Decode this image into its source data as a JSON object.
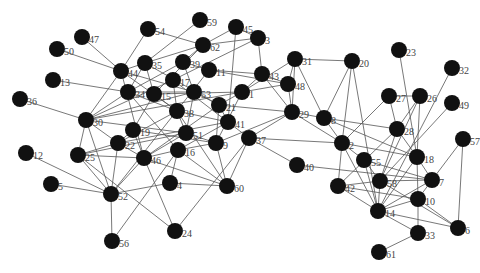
{
  "diagram": {
    "type": "network-graph",
    "node_color": "#111111",
    "edge_color": "#555555",
    "label_color": "#444444",
    "nodes": [
      {
        "id": "59",
        "x": 200,
        "y": 20
      },
      {
        "id": "45",
        "x": 236,
        "y": 27
      },
      {
        "id": "3",
        "x": 258,
        "y": 38
      },
      {
        "id": "62",
        "x": 203,
        "y": 45
      },
      {
        "id": "54",
        "x": 148,
        "y": 29
      },
      {
        "id": "47",
        "x": 82,
        "y": 37
      },
      {
        "id": "50",
        "x": 57,
        "y": 49
      },
      {
        "id": "44",
        "x": 121,
        "y": 71
      },
      {
        "id": "35",
        "x": 145,
        "y": 63
      },
      {
        "id": "39",
        "x": 183,
        "y": 62
      },
      {
        "id": "11",
        "x": 209,
        "y": 70
      },
      {
        "id": "17",
        "x": 173,
        "y": 80
      },
      {
        "id": "43",
        "x": 262,
        "y": 74
      },
      {
        "id": "31",
        "x": 295,
        "y": 59
      },
      {
        "id": "20",
        "x": 352,
        "y": 61
      },
      {
        "id": "13",
        "x": 53,
        "y": 80
      },
      {
        "id": "36",
        "x": 20,
        "y": 99
      },
      {
        "id": "34",
        "x": 128,
        "y": 92
      },
      {
        "id": "15",
        "x": 154,
        "y": 94
      },
      {
        "id": "53",
        "x": 194,
        "y": 92
      },
      {
        "id": "1",
        "x": 242,
        "y": 92
      },
      {
        "id": "48",
        "x": 288,
        "y": 84
      },
      {
        "id": "23",
        "x": 399,
        "y": 50
      },
      {
        "id": "32",
        "x": 452,
        "y": 68
      },
      {
        "id": "27",
        "x": 389,
        "y": 96
      },
      {
        "id": "26",
        "x": 420,
        "y": 96
      },
      {
        "id": "49",
        "x": 452,
        "y": 103
      },
      {
        "id": "30",
        "x": 86,
        "y": 120
      },
      {
        "id": "38",
        "x": 177,
        "y": 111
      },
      {
        "id": "21",
        "x": 219,
        "y": 105
      },
      {
        "id": "41",
        "x": 228,
        "y": 122
      },
      {
        "id": "29",
        "x": 292,
        "y": 112
      },
      {
        "id": "8",
        "x": 324,
        "y": 118
      },
      {
        "id": "28",
        "x": 397,
        "y": 129
      },
      {
        "id": "19",
        "x": 133,
        "y": 130
      },
      {
        "id": "51",
        "x": 186,
        "y": 133
      },
      {
        "id": "9",
        "x": 216,
        "y": 143
      },
      {
        "id": "37",
        "x": 249,
        "y": 138
      },
      {
        "id": "22",
        "x": 118,
        "y": 143
      },
      {
        "id": "25",
        "x": 78,
        "y": 155
      },
      {
        "id": "46",
        "x": 144,
        "y": 158
      },
      {
        "id": "16",
        "x": 178,
        "y": 150
      },
      {
        "id": "12",
        "x": 26,
        "y": 153
      },
      {
        "id": "2",
        "x": 342,
        "y": 143
      },
      {
        "id": "55",
        "x": 364,
        "y": 160
      },
      {
        "id": "18",
        "x": 417,
        "y": 157
      },
      {
        "id": "57",
        "x": 463,
        "y": 139
      },
      {
        "id": "40",
        "x": 297,
        "y": 165
      },
      {
        "id": "7",
        "x": 432,
        "y": 180
      },
      {
        "id": "42",
        "x": 338,
        "y": 186
      },
      {
        "id": "58",
        "x": 380,
        "y": 181
      },
      {
        "id": "10",
        "x": 418,
        "y": 199
      },
      {
        "id": "14",
        "x": 378,
        "y": 211
      },
      {
        "id": "6",
        "x": 458,
        "y": 228
      },
      {
        "id": "33",
        "x": 418,
        "y": 233
      },
      {
        "id": "61",
        "x": 379,
        "y": 252
      },
      {
        "id": "5",
        "x": 51,
        "y": 184
      },
      {
        "id": "52",
        "x": 111,
        "y": 194
      },
      {
        "id": "4",
        "x": 170,
        "y": 183
      },
      {
        "id": "60",
        "x": 227,
        "y": 186
      },
      {
        "id": "24",
        "x": 175,
        "y": 231
      },
      {
        "id": "56",
        "x": 112,
        "y": 241
      }
    ],
    "edges": [
      [
        "47",
        "44"
      ],
      [
        "50",
        "44"
      ],
      [
        "54",
        "44"
      ],
      [
        "54",
        "62"
      ],
      [
        "59",
        "35"
      ],
      [
        "45",
        "62"
      ],
      [
        "45",
        "3"
      ],
      [
        "45",
        "41"
      ],
      [
        "3",
        "62"
      ],
      [
        "3",
        "43"
      ],
      [
        "3",
        "17"
      ],
      [
        "62",
        "35"
      ],
      [
        "62",
        "39"
      ],
      [
        "62",
        "15"
      ],
      [
        "13",
        "34"
      ],
      [
        "36",
        "30"
      ],
      [
        "44",
        "35"
      ],
      [
        "44",
        "30"
      ],
      [
        "44",
        "38"
      ],
      [
        "44",
        "53"
      ],
      [
        "44",
        "46"
      ],
      [
        "35",
        "15"
      ],
      [
        "35",
        "34"
      ],
      [
        "35",
        "21"
      ],
      [
        "39",
        "34"
      ],
      [
        "39",
        "53"
      ],
      [
        "39",
        "11"
      ],
      [
        "11",
        "43"
      ],
      [
        "11",
        "48"
      ],
      [
        "11",
        "52"
      ],
      [
        "17",
        "30"
      ],
      [
        "17",
        "38"
      ],
      [
        "17",
        "41"
      ],
      [
        "43",
        "1"
      ],
      [
        "43",
        "48"
      ],
      [
        "43",
        "29"
      ],
      [
        "31",
        "48"
      ],
      [
        "31",
        "29"
      ],
      [
        "31",
        "20"
      ],
      [
        "31",
        "8"
      ],
      [
        "31",
        "1"
      ],
      [
        "20",
        "8"
      ],
      [
        "20",
        "2"
      ],
      [
        "20",
        "14"
      ],
      [
        "34",
        "30"
      ],
      [
        "34",
        "53"
      ],
      [
        "34",
        "38"
      ],
      [
        "34",
        "16"
      ],
      [
        "15",
        "1"
      ],
      [
        "15",
        "38"
      ],
      [
        "15",
        "19"
      ],
      [
        "53",
        "21"
      ],
      [
        "53",
        "30"
      ],
      [
        "53",
        "51"
      ],
      [
        "1",
        "21"
      ],
      [
        "1",
        "48"
      ],
      [
        "1",
        "9"
      ],
      [
        "48",
        "29"
      ],
      [
        "30",
        "22"
      ],
      [
        "30",
        "25"
      ],
      [
        "30",
        "52"
      ],
      [
        "30",
        "51"
      ],
      [
        "30",
        "1"
      ],
      [
        "38",
        "51"
      ],
      [
        "38",
        "41"
      ],
      [
        "38",
        "22"
      ],
      [
        "38",
        "60"
      ],
      [
        "21",
        "41"
      ],
      [
        "21",
        "9"
      ],
      [
        "21",
        "46"
      ],
      [
        "21",
        "29"
      ],
      [
        "41",
        "37"
      ],
      [
        "41",
        "22"
      ],
      [
        "41",
        "16"
      ],
      [
        "29",
        "8"
      ],
      [
        "29",
        "2"
      ],
      [
        "29",
        "9"
      ],
      [
        "29",
        "37"
      ],
      [
        "8",
        "2"
      ],
      [
        "8",
        "18"
      ],
      [
        "8",
        "28"
      ],
      [
        "19",
        "22"
      ],
      [
        "19",
        "46"
      ],
      [
        "19",
        "9"
      ],
      [
        "51",
        "46"
      ],
      [
        "51",
        "9"
      ],
      [
        "51",
        "25"
      ],
      [
        "9",
        "60"
      ],
      [
        "9",
        "16"
      ],
      [
        "37",
        "40"
      ],
      [
        "37",
        "60"
      ],
      [
        "37",
        "24"
      ],
      [
        "37",
        "2"
      ],
      [
        "22",
        "25"
      ],
      [
        "22",
        "52"
      ],
      [
        "22",
        "46"
      ],
      [
        "25",
        "52"
      ],
      [
        "25",
        "46"
      ],
      [
        "46",
        "52"
      ],
      [
        "46",
        "24"
      ],
      [
        "46",
        "60"
      ],
      [
        "46",
        "16"
      ],
      [
        "16",
        "4"
      ],
      [
        "16",
        "60"
      ],
      [
        "12",
        "52"
      ],
      [
        "5",
        "52"
      ],
      [
        "52",
        "56"
      ],
      [
        "52",
        "4"
      ],
      [
        "4",
        "60"
      ],
      [
        "56",
        "16"
      ],
      [
        "24",
        "25"
      ],
      [
        "2",
        "55"
      ],
      [
        "2",
        "42"
      ],
      [
        "2",
        "18"
      ],
      [
        "2",
        "27"
      ],
      [
        "2",
        "14"
      ],
      [
        "55",
        "7"
      ],
      [
        "55",
        "14"
      ],
      [
        "55",
        "58"
      ],
      [
        "28",
        "27"
      ],
      [
        "28",
        "26"
      ],
      [
        "28",
        "18"
      ],
      [
        "28",
        "58"
      ],
      [
        "28",
        "42"
      ],
      [
        "27",
        "26"
      ],
      [
        "23",
        "18"
      ],
      [
        "26",
        "18"
      ],
      [
        "26",
        "58"
      ],
      [
        "32",
        "14"
      ],
      [
        "49",
        "58"
      ],
      [
        "18",
        "14"
      ],
      [
        "18",
        "10"
      ],
      [
        "18",
        "7"
      ],
      [
        "57",
        "7"
      ],
      [
        "57",
        "6"
      ],
      [
        "40",
        "7"
      ],
      [
        "42",
        "58"
      ],
      [
        "42",
        "10"
      ],
      [
        "42",
        "14"
      ],
      [
        "58",
        "7"
      ],
      [
        "58",
        "6"
      ],
      [
        "58",
        "14"
      ],
      [
        "10",
        "14"
      ],
      [
        "10",
        "33"
      ],
      [
        "10",
        "6"
      ],
      [
        "14",
        "6"
      ],
      [
        "14",
        "33"
      ],
      [
        "33",
        "61"
      ],
      [
        "7",
        "14"
      ],
      [
        "7",
        "10"
      ]
    ]
  }
}
